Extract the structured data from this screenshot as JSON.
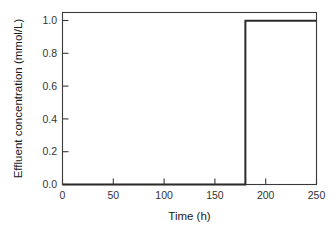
{
  "chart_data": {
    "type": "line",
    "title": "",
    "subtitle": "",
    "xlabel": "Time (h)",
    "ylabel": "Effluent concentration (mmol/L)",
    "xlim": [
      0,
      250
    ],
    "ylim": [
      0.0,
      1.05
    ],
    "xticks": [
      0,
      50,
      100,
      150,
      200,
      250
    ],
    "xtick_labels": [
      "0",
      "50",
      "100",
      "150",
      "200",
      "250"
    ],
    "yticks": [
      0.0,
      0.2,
      0.4,
      0.6,
      0.8,
      1.0
    ],
    "ytick_labels": [
      "0.0",
      "0.2",
      "0.4",
      "0.6",
      "0.8",
      "1.0"
    ],
    "grid": false,
    "legend": false,
    "legend_position": "none",
    "series": [
      {
        "name": "Effluent concentration",
        "color": "#2b2b2b",
        "line_width": 2.0,
        "x": [
          0,
          180,
          180,
          250
        ],
        "values": [
          0.0,
          0.0,
          1.0,
          1.0
        ],
        "breakthrough_time": 180,
        "plateau_value": 1.0,
        "baseline_value": 0.0
      }
    ],
    "annotations": []
  },
  "axes": {
    "y_title": "Effluent concentration (mmol/L)",
    "x_title": "Time (h)",
    "tick_direction": "in",
    "frame": "full-box"
  }
}
